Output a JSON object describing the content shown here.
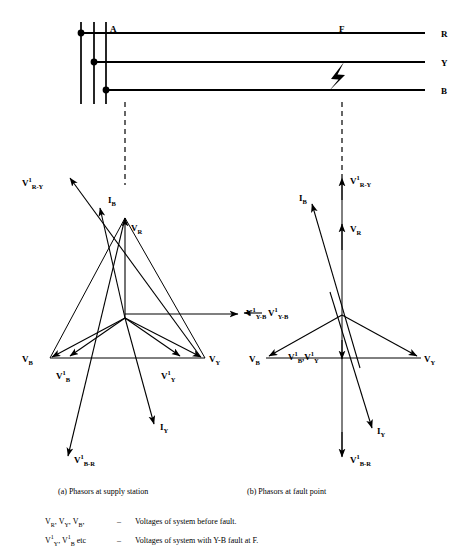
{
  "figure": {
    "line_colors": {
      "ink": "#000000",
      "paper": "#ffffff"
    }
  },
  "single_line": {
    "point_labels": [
      {
        "name": "supply-station-label",
        "text": "A",
        "x": 110,
        "y": 32
      },
      {
        "name": "fault-point-label",
        "text": "F",
        "x": 339,
        "y": 32
      }
    ],
    "phase_labels": [
      {
        "name": "phase-r-label",
        "text": "R",
        "x": 441,
        "y": 42
      },
      {
        "name": "phase-y-label",
        "text": "Y",
        "x": 441,
        "y": 66
      },
      {
        "name": "phase-b-label",
        "text": "B",
        "x": 441,
        "y": 90
      }
    ],
    "fault_marker": "lightning-bolt"
  },
  "phasor_left": {
    "caption": "(a)  Phasors at supply station",
    "labels": [
      {
        "name": "label-v1-r-y",
        "base": "V",
        "sup": "1",
        "sub": "R-Y",
        "x": 22,
        "y": 183
      },
      {
        "name": "label-i-b",
        "base": "I",
        "sup": "",
        "sub": "B",
        "x": 108,
        "y": 202
      },
      {
        "name": "label-v-r",
        "base": "V",
        "sup": "",
        "sub": "R",
        "x": 130,
        "y": 230
      },
      {
        "name": "label-v1-y-b",
        "base": "V",
        "sup": "1",
        "sub": "Y-B",
        "x": 247,
        "y": 313
      },
      {
        "name": "label-v-b",
        "base": "V",
        "sup": "",
        "sub": "B",
        "x": 22,
        "y": 360
      },
      {
        "name": "label-v1-b",
        "base": "V",
        "sup": "1",
        "sub": "B",
        "x": 57,
        "y": 377
      },
      {
        "name": "label-v1-y",
        "base": "V",
        "sup": "1",
        "sub": "Y",
        "x": 163,
        "y": 377
      },
      {
        "name": "label-v-y",
        "base": "V",
        "sup": "",
        "sub": "Y",
        "x": 211,
        "y": 360
      },
      {
        "name": "label-i-y",
        "base": "I",
        "sup": "",
        "sub": "Y",
        "x": 161,
        "y": 428
      },
      {
        "name": "label-v1-b-r",
        "base": "V",
        "sup": "1",
        "sub": "B-R",
        "x": 74,
        "y": 461
      }
    ]
  },
  "phasor_right": {
    "caption": "(b)  Phasors at fault point",
    "labels": [
      {
        "name": "label-v1-r-y",
        "base": "V",
        "sup": "1",
        "sub": "R-Y",
        "x": 350,
        "y": 181
      },
      {
        "name": "label-i-b",
        "base": "I",
        "sup": "",
        "sub": "B",
        "x": 300,
        "y": 200
      },
      {
        "name": "label-v-r",
        "base": "V",
        "sup": "",
        "sub": "R",
        "x": 350,
        "y": 231
      },
      {
        "name": "label-v1-y-b",
        "base": "V",
        "sup": "1",
        "sub": "Y-B",
        "x": 293,
        "y": 313
      },
      {
        "name": "label-v-b",
        "base": "V",
        "sup": "",
        "sub": "B",
        "x": 250,
        "y": 360
      },
      {
        "name": "label-v1-b-v1-y",
        "text": "V1B,V1Y",
        "x": 292,
        "y": 358
      },
      {
        "name": "label-v-y",
        "base": "V",
        "sup": "",
        "sub": "Y",
        "x": 426,
        "y": 360
      },
      {
        "name": "label-i-y",
        "base": "I",
        "sup": "",
        "sub": "Y",
        "x": 378,
        "y": 432
      },
      {
        "name": "label-v1-b-r",
        "base": "V",
        "sup": "1",
        "sub": "B-R",
        "x": 350,
        "y": 461
      }
    ]
  },
  "legend": {
    "rows": [
      {
        "name": "legend-row-before-fault",
        "symbols": "VR, VY, VB,",
        "dash": "–",
        "description": "Voltages of system before fault."
      },
      {
        "name": "legend-row-with-fault",
        "symbols": "V1Y, V1B etc",
        "dash": "–",
        "description": "Voltages of system with Y-B fault at F."
      }
    ]
  }
}
